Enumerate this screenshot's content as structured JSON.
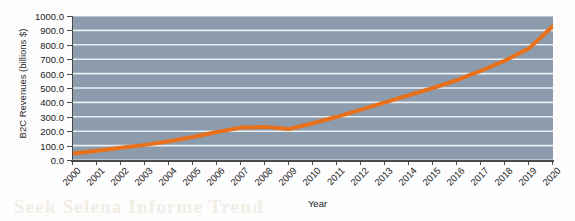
{
  "chart_data": {
    "type": "line",
    "title": "",
    "xlabel": "Year",
    "ylabel": "B2C Revenues (billions $)",
    "categories": [
      "2000",
      "2001",
      "2002",
      "2003",
      "2004",
      "2005",
      "2006",
      "2007",
      "2008",
      "2009",
      "2010",
      "2011",
      "2012",
      "2013",
      "2014",
      "2015",
      "2016",
      "2017",
      "2018",
      "2019",
      "2020"
    ],
    "values": [
      45,
      65,
      85,
      105,
      130,
      160,
      195,
      225,
      230,
      215,
      255,
      300,
      350,
      400,
      450,
      500,
      555,
      620,
      690,
      775,
      930
    ],
    "series": [
      {
        "name": "B2C Revenues",
        "color": "#e8701a",
        "values": [
          45,
          65,
          85,
          105,
          130,
          160,
          195,
          225,
          230,
          215,
          255,
          300,
          350,
          400,
          450,
          500,
          555,
          620,
          690,
          775,
          930
        ]
      }
    ],
    "ylim": [
      0,
      1000
    ],
    "ytick_step": 100,
    "ytick_labels": [
      "0.0",
      "100.0",
      "200.0",
      "300.0",
      "400.0",
      "500.0",
      "600.0",
      "700.0",
      "800.0",
      "900.0",
      "1000.0"
    ],
    "grid": true,
    "grid_axis": "y",
    "grid_color": "#e9eef2",
    "plot_background": "#8c9cac",
    "legend": "none",
    "line_width": 4,
    "markers": false
  },
  "artifact": {
    "bleed_text": "Seek Selena Informe Trend"
  }
}
